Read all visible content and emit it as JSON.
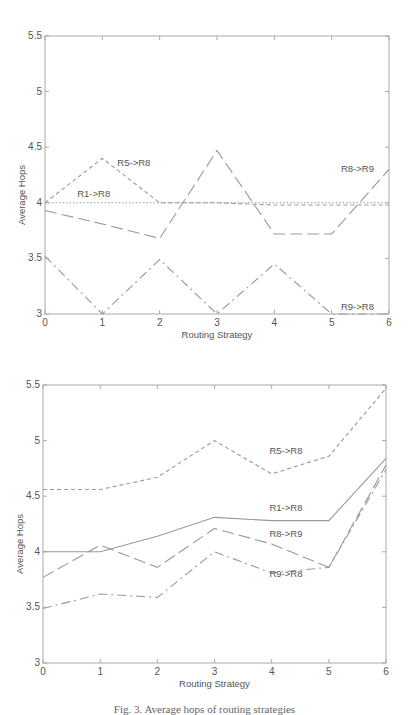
{
  "chart_data": [
    {
      "type": "line",
      "title": "",
      "xlabel": "Routing Strategy",
      "ylabel": "Average Hops",
      "xlim": [
        0,
        6
      ],
      "ylim": [
        3,
        5.5
      ],
      "x_ticks": [
        "0",
        "1",
        "2",
        "3",
        "4",
        "5",
        "6"
      ],
      "y_ticks": [
        "3",
        "3.5",
        "4",
        "4.5",
        "5",
        "5.5"
      ],
      "grid": false,
      "legend": "inline annotations",
      "x": [
        0,
        1,
        2,
        3,
        4,
        5,
        6
      ],
      "series": [
        {
          "name": "R5->R8",
          "style": "dashed",
          "values": [
            4.0,
            4.4,
            4.0,
            4.0,
            3.98,
            3.98,
            3.98
          ]
        },
        {
          "name": "R1->R8",
          "style": "dotted",
          "values": [
            4.0,
            4.0,
            4.0,
            4.0,
            4.0,
            4.0,
            4.0
          ]
        },
        {
          "name": "R8->R9",
          "style": "long-dash",
          "values": [
            3.93,
            3.81,
            3.68,
            4.47,
            3.72,
            3.72,
            4.3
          ]
        },
        {
          "name": "R9->R8",
          "style": "dash-dot",
          "values": [
            3.52,
            3.0,
            3.49,
            3.0,
            3.45,
            3.0,
            3.0
          ]
        }
      ],
      "annotations": [
        {
          "text": "R5->R8",
          "x": 1.55,
          "y": 4.33
        },
        {
          "text": "R1->R8",
          "x": 0.85,
          "y": 4.05
        },
        {
          "text": "R8->R9",
          "x": 5.45,
          "y": 4.28
        },
        {
          "text": "R9->R8",
          "x": 5.45,
          "y": 3.04
        }
      ]
    },
    {
      "type": "line",
      "title": "",
      "xlabel": "Routing Strategy",
      "ylabel": "Average Hops",
      "xlim": [
        0,
        6
      ],
      "ylim": [
        3,
        5.5
      ],
      "x_ticks": [
        "0",
        "1",
        "2",
        "3",
        "4",
        "5",
        "6"
      ],
      "y_ticks": [
        "3",
        "3.5",
        "4",
        "4.5",
        "5",
        "5.5"
      ],
      "grid": false,
      "legend": "inline annotations",
      "x": [
        0,
        1,
        2,
        3,
        4,
        5,
        6
      ],
      "series": [
        {
          "name": "R5->R8",
          "style": "dashed",
          "values": [
            4.56,
            4.56,
            4.67,
            5.0,
            4.7,
            4.86,
            5.47
          ]
        },
        {
          "name": "R1->R8",
          "style": "solid",
          "values": [
            4.0,
            4.0,
            4.14,
            4.31,
            4.28,
            4.28,
            4.84
          ]
        },
        {
          "name": "R8->R9",
          "style": "long-dash",
          "values": [
            3.77,
            4.06,
            3.86,
            4.21,
            4.07,
            3.86,
            4.78
          ]
        },
        {
          "name": "R9->R8",
          "style": "dash-dot",
          "values": [
            3.49,
            3.62,
            3.59,
            4.0,
            3.81,
            3.86,
            4.74
          ]
        }
      ],
      "annotations": [
        {
          "text": "R5->R8",
          "x": 4.25,
          "y": 4.88
        },
        {
          "text": "R1->R8",
          "x": 4.25,
          "y": 4.37
        },
        {
          "text": "R8->R9",
          "x": 4.25,
          "y": 4.13
        },
        {
          "text": "R9->R8",
          "x": 4.25,
          "y": 3.77
        }
      ]
    }
  ],
  "caption": "Fig. 3. Average hops of routing strategies"
}
